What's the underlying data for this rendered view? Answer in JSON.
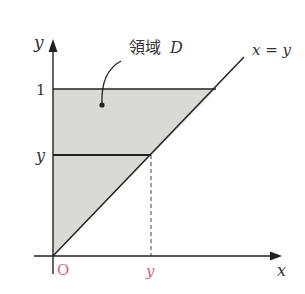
{
  "diagram": {
    "region_label": "領域 D",
    "region_label_word": "領域",
    "region_label_symbol": "D",
    "line_label": "x = y",
    "axis_x_label": "x",
    "axis_y_label": "y",
    "origin_label": "O",
    "y_tick_1": "1",
    "y_tick_y": "y",
    "x_tick_y": "y",
    "colors": {
      "region_fill": "#d9d9d6",
      "axis": "#222222",
      "accent": "#d9607a"
    }
  }
}
